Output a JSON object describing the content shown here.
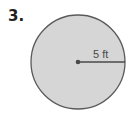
{
  "problem": {
    "number": "3."
  },
  "figure": {
    "shape": "circle",
    "radius_label": "5 ft",
    "colors": {
      "fill": "#d6d6d6",
      "stroke": "#5a5a5a",
      "radius_line": "#4a4a4a",
      "center_dot": "#4a4a4a"
    }
  }
}
